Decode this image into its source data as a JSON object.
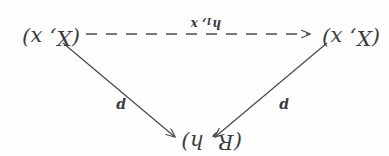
{
  "figure": {
    "kind": "commutative-diagram",
    "orientation_note": "upside-down",
    "background_color": "#fefefe",
    "ink_color": "#3c3c40"
  },
  "nodes": {
    "top": "(R, h)",
    "bottom_left": "(X, x)",
    "bottom_right": "(X, x)"
  },
  "edges": {
    "left_label": "p",
    "right_label": "p",
    "bottom_label_main": "h",
    "bottom_label_sub": "1",
    "bottom_label_tail": ", x"
  }
}
